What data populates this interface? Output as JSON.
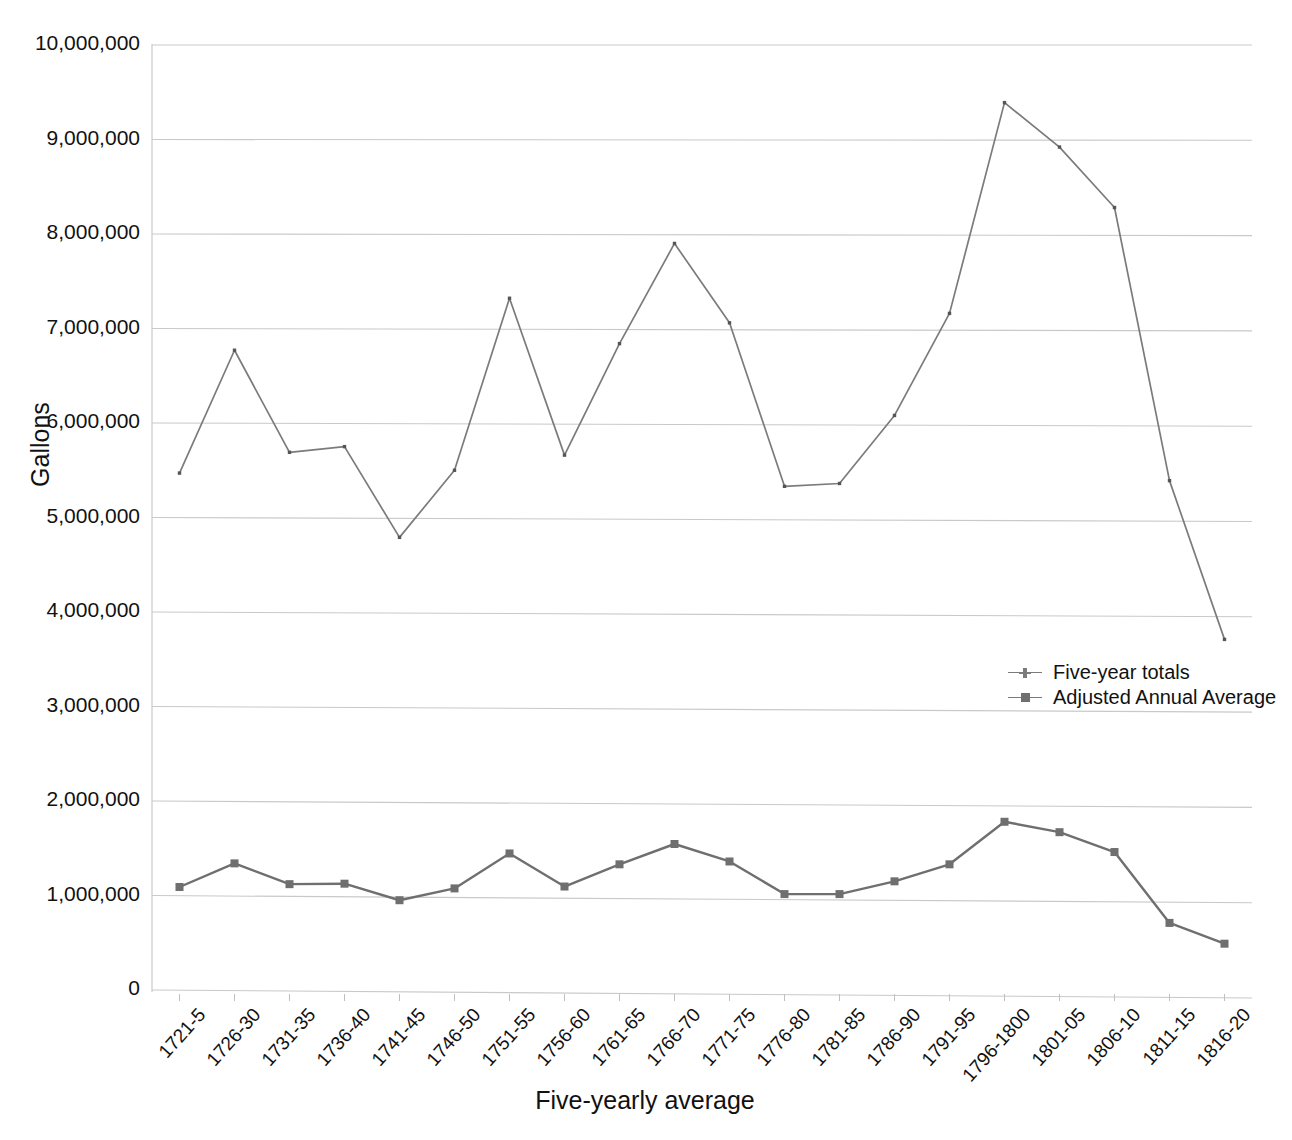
{
  "chart_data": {
    "type": "line",
    "title": "",
    "xlabel": "Five-yearly average",
    "ylabel": "Gallons",
    "ylim": [
      0,
      10000000
    ],
    "ytick_step": 1000000,
    "grid": true,
    "legend_position": "inside-right",
    "categories": [
      "1721-5",
      "1726-30",
      "1731-35",
      "1736-40",
      "1741-45",
      "1746-50",
      "1751-55",
      "1756-60",
      "1761-65",
      "1766-70",
      "1771-75",
      "1776-80",
      "1781-85",
      "1786-90",
      "1791-95",
      "1796-1800",
      "1801-05",
      "1806-10",
      "1811-15",
      "1816-20"
    ],
    "ytick_labels": [
      "10,000,000",
      "9,000,000",
      "8,000,000",
      "7,000,000",
      "6,000,000",
      "5,000,000",
      "4,000,000",
      "3,000,000",
      "2,000,000",
      "1,000,000",
      "0"
    ],
    "ytick_values": [
      10000000,
      9000000,
      8000000,
      7000000,
      6000000,
      5000000,
      4000000,
      3000000,
      2000000,
      1000000,
      0
    ],
    "series": [
      {
        "name": "Five-year totals",
        "color": "#7b7b7b",
        "marker": "cross",
        "values": [
          5470000,
          6770000,
          5690000,
          5750000,
          4790000,
          5500000,
          7320000,
          5660000,
          6840000,
          7900000,
          7060000,
          5330000,
          5360000,
          6080000,
          7160000,
          9390000,
          8920000,
          8280000,
          5390000,
          3710000
        ]
      },
      {
        "name": "Adjusted Annual Average",
        "color": "#6f6f6f",
        "marker": "square",
        "values": [
          1090000,
          1340000,
          1120000,
          1125000,
          950000,
          1075000,
          1445000,
          1095000,
          1330000,
          1545000,
          1360000,
          1015000,
          1015000,
          1150000,
          1330000,
          1780000,
          1670000,
          1460000,
          710000,
          490000
        ]
      }
    ]
  },
  "legend": {
    "items": [
      {
        "label": "Five-year totals"
      },
      {
        "label": "Adjusted Annual Average"
      }
    ]
  }
}
